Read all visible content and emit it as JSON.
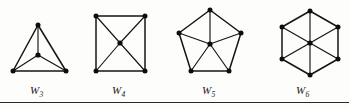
{
  "figure": {
    "caption_rule": true,
    "background_color": "#fdfdfc",
    "ink_color": "#141414",
    "width": 349,
    "height": 108
  },
  "labels": {
    "w3": "W",
    "w3_sub": "3",
    "w4": "W",
    "w4_sub": "4",
    "w5": "W",
    "w5_sub": "5",
    "w6": "W",
    "w6_sub": "6"
  },
  "chart_data": {
    "type": "diagram",
    "title": "",
    "graphs": [
      {
        "name": "W3",
        "label": "W",
        "subscript": "3",
        "rim_size": 3,
        "vertex_count": 4,
        "edge_count": 6,
        "hub": {
          "x": 38,
          "y": 55
        },
        "rim": [
          {
            "x": 38,
            "y": 25
          },
          {
            "x": 66,
            "y": 71
          },
          {
            "x": 13,
            "y": 71
          }
        ],
        "label_pos": {
          "x": 30,
          "y": 84
        }
      },
      {
        "name": "W4",
        "label": "W",
        "subscript": "4",
        "rim_size": 4,
        "vertex_count": 5,
        "edge_count": 8,
        "hub": {
          "x": 120,
          "y": 43
        },
        "rim": [
          {
            "x": 96,
            "y": 16
          },
          {
            "x": 145,
            "y": 16
          },
          {
            "x": 145,
            "y": 71
          },
          {
            "x": 96,
            "y": 71
          }
        ],
        "label_pos": {
          "x": 112,
          "y": 84
        }
      },
      {
        "name": "W5",
        "label": "W",
        "subscript": "5",
        "rim_size": 5,
        "vertex_count": 6,
        "edge_count": 10,
        "hub": {
          "x": 210,
          "y": 44
        },
        "rim": [
          {
            "x": 210,
            "y": 10
          },
          {
            "x": 241,
            "y": 33
          },
          {
            "x": 229,
            "y": 71
          },
          {
            "x": 191,
            "y": 71
          },
          {
            "x": 179,
            "y": 33
          }
        ],
        "label_pos": {
          "x": 202,
          "y": 84
        }
      },
      {
        "name": "W6",
        "label": "W",
        "subscript": "6",
        "rim_size": 6,
        "vertex_count": 7,
        "edge_count": 12,
        "hub": {
          "x": 310,
          "y": 43
        },
        "rim": [
          {
            "x": 310,
            "y": 11
          },
          {
            "x": 338,
            "y": 27
          },
          {
            "x": 338,
            "y": 59
          },
          {
            "x": 310,
            "y": 75
          },
          {
            "x": 282,
            "y": 59
          },
          {
            "x": 282,
            "y": 27
          }
        ],
        "label_pos": {
          "x": 296,
          "y": 84
        }
      }
    ]
  }
}
